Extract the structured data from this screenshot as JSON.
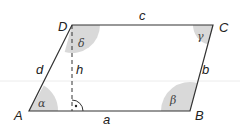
{
  "figure": {
    "vertices": {
      "A": "A",
      "B": "B",
      "C": "C",
      "D": "D"
    },
    "sides": {
      "a": "a",
      "b": "b",
      "c": "c",
      "d": "d"
    },
    "height": "h",
    "angles": {
      "alpha": "α",
      "beta": "β",
      "gamma": "γ",
      "delta": "δ"
    },
    "colors": {
      "stroke": "#333333",
      "angle_fill": "#d9d9d9",
      "guide": "#ececec"
    }
  }
}
